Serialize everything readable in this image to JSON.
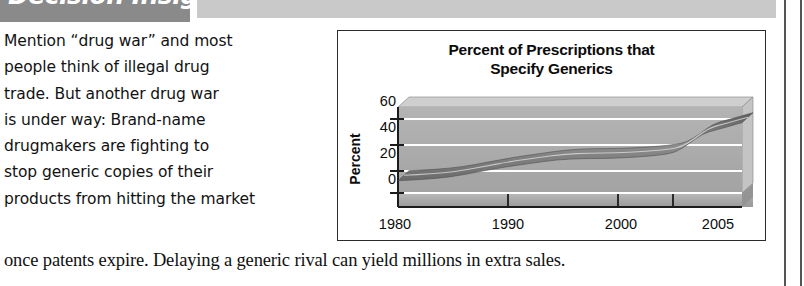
{
  "banner": {
    "title": "Decision Insight",
    "dark_color": "#8a8a8a",
    "light_color": "#c9c9c9"
  },
  "article": {
    "body_lines": [
      "Mention “drug war” and most",
      "people think of illegal drug",
      "trade. But another drug war",
      "is under way: Brand-name",
      "drugmakers are fighting to",
      "stop generic copies of their",
      "products from hitting the market"
    ],
    "closing_line": "once patents expire. Delaying a generic rival can yield millions in extra sales."
  },
  "chart_data": {
    "type": "area",
    "title_line1": "Percent of Prescriptions that",
    "title_line2": "Specify Generics",
    "xlabel": "",
    "ylabel": "Percent",
    "ylim": [
      0,
      70
    ],
    "xlim": [
      1980,
      2006
    ],
    "yticks": [
      60,
      40,
      20,
      0
    ],
    "xticks": [
      1980,
      1990,
      2000,
      2005
    ],
    "grid": true,
    "legend": "none",
    "series": [
      {
        "name": "Percent of prescriptions specifying generics",
        "x": [
          1980,
          1982,
          1984,
          1986,
          1988,
          1990,
          1992,
          1994,
          1996,
          1998,
          2000,
          2001,
          2002,
          2003,
          2004,
          2005,
          2006
        ],
        "values": [
          10,
          11,
          13,
          17,
          21,
          24,
          27,
          28,
          28,
          29,
          31,
          33,
          40,
          48,
          51,
          54,
          57
        ]
      }
    ],
    "plot_fill": "#a8a8a8",
    "gridline_color": "#ffffff",
    "band_color": "#6e6e6e"
  }
}
